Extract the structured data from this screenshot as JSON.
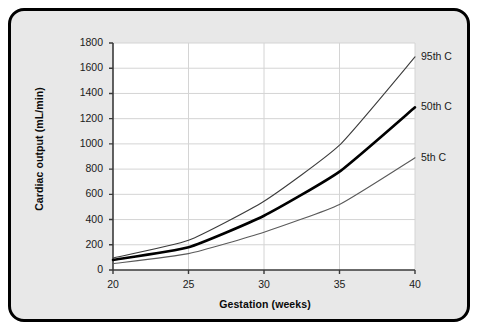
{
  "chart_data": {
    "type": "line",
    "title": "",
    "xlabel": "Gestation (weeks)",
    "ylabel": "Cardiac output (mL/min)",
    "xlim": [
      20,
      40
    ],
    "ylim": [
      0,
      1800
    ],
    "grid": true,
    "legend_position": "right-of-plot-inline",
    "xticks": [
      20,
      25,
      30,
      35,
      40
    ],
    "yticks": [
      0,
      200,
      400,
      600,
      800,
      1000,
      1200,
      1400,
      1600,
      1800
    ],
    "xtick_labels": [
      "20",
      "25",
      "30",
      "35",
      "40"
    ],
    "ytick_labels": [
      "0",
      "200",
      "400",
      "600",
      "800",
      "1000",
      "1200",
      "1400",
      "1600",
      "1800"
    ],
    "x": [
      20,
      25,
      30,
      35,
      40
    ],
    "series": [
      {
        "name": "95th C",
        "label": "95th C",
        "color": "#3c3c3c",
        "width": 1.1,
        "values": [
          95,
          235,
          545,
          990,
          1690
        ]
      },
      {
        "name": "50th C",
        "label": "50th C",
        "color": "#000000",
        "width": 2.6,
        "values": [
          80,
          180,
          430,
          780,
          1290
        ]
      },
      {
        "name": "5th C",
        "label": "5th C",
        "color": "#5a5a5a",
        "width": 1.1,
        "values": [
          50,
          130,
          300,
          520,
          890
        ]
      }
    ]
  },
  "figure": {
    "plot_background": "#ffffff",
    "panel_background": "#e8e8e8",
    "grid_color": "#d4d4d4",
    "axis_color": "#3a3a3a",
    "border_color": "#000000"
  }
}
